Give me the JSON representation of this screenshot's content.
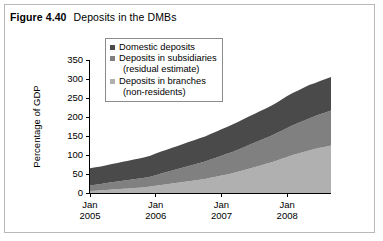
{
  "figure": {
    "number_label": "Figure 4.40",
    "title": "Deposits in the DMBs"
  },
  "legend": {
    "position": "top-center-inside",
    "items": [
      {
        "label": "Domestic deposits",
        "sublabel": "",
        "color": "#4a4a4a"
      },
      {
        "label": "Deposits in subsidiaries",
        "sublabel": "(residual estimate)",
        "color": "#808080"
      },
      {
        "label": "Deposits in branches",
        "sublabel": "(non-residents)",
        "color": "#b0b0b0"
      }
    ]
  },
  "axes": {
    "ylabel": "Percentage of GDP",
    "yticks": [
      "0",
      "50",
      "100",
      "150",
      "200",
      "250",
      "300",
      "350"
    ],
    "xticks": [
      {
        "month": "Jan",
        "year": "2005"
      },
      {
        "month": "Jan",
        "year": "2006"
      },
      {
        "month": "Jan",
        "year": "2007"
      },
      {
        "month": "Jan",
        "year": "2008"
      }
    ]
  },
  "chart_data": {
    "type": "area",
    "stacked": true,
    "title": "Deposits in the DMBs",
    "xlabel": "",
    "ylabel": "Percentage of GDP",
    "ylim": [
      0,
      350
    ],
    "grid": false,
    "legend_position": "top-center-inside",
    "x": [
      "Jan 2005",
      "Feb 2005",
      "Mar 2005",
      "Apr 2005",
      "May 2005",
      "Jun 2005",
      "Jul 2005",
      "Aug 2005",
      "Sep 2005",
      "Oct 2005",
      "Nov 2005",
      "Dec 2005",
      "Jan 2006",
      "Feb 2006",
      "Mar 2006",
      "Apr 2006",
      "May 2006",
      "Jun 2006",
      "Jul 2006",
      "Aug 2006",
      "Sep 2006",
      "Oct 2006",
      "Nov 2006",
      "Dec 2006",
      "Jan 2007",
      "Feb 2007",
      "Mar 2007",
      "Apr 2007",
      "May 2007",
      "Jun 2007",
      "Jul 2007",
      "Aug 2007",
      "Sep 2007",
      "Oct 2007",
      "Nov 2007",
      "Dec 2007",
      "Jan 2008",
      "Feb 2008",
      "Mar 2008",
      "Apr 2008",
      "May 2008",
      "Jun 2008",
      "Jul 2008",
      "Aug 2008",
      "Sep 2008"
    ],
    "series": [
      {
        "name": "Deposits in branches (non-residents)",
        "color": "#b0b0b0",
        "values": [
          5,
          6,
          7,
          8,
          9,
          10,
          11,
          12,
          13,
          14,
          15,
          17,
          19,
          21,
          23,
          25,
          27,
          29,
          31,
          33,
          35,
          37,
          40,
          43,
          46,
          49,
          52,
          56,
          60,
          64,
          68,
          72,
          76,
          80,
          85,
          90,
          95,
          100,
          104,
          108,
          112,
          116,
          119,
          122,
          125
        ]
      },
      {
        "name": "Deposits in subsidiaries (residual estimate)",
        "color": "#808080",
        "values": [
          15,
          16,
          17,
          18,
          19,
          20,
          21,
          22,
          23,
          24,
          25,
          26,
          28,
          30,
          32,
          34,
          36,
          38,
          40,
          42,
          44,
          46,
          48,
          50,
          52,
          54,
          56,
          58,
          60,
          62,
          64,
          66,
          68,
          70,
          72,
          74,
          76,
          78,
          80,
          82,
          84,
          86,
          88,
          90,
          92
        ]
      },
      {
        "name": "Domestic deposits",
        "color": "#4a4a4a",
        "values": [
          45,
          46,
          46,
          47,
          48,
          49,
          50,
          51,
          52,
          53,
          54,
          55,
          57,
          58,
          59,
          60,
          61,
          62,
          63,
          64,
          65,
          66,
          67,
          68,
          70,
          71,
          72,
          73,
          74,
          75,
          76,
          77,
          78,
          79,
          80,
          82,
          84,
          85,
          86,
          87,
          88,
          87,
          88,
          88,
          88
        ]
      }
    ],
    "totals": [
      65,
      68,
      70,
      73,
      76,
      79,
      82,
      85,
      88,
      91,
      94,
      98,
      104,
      109,
      114,
      119,
      124,
      129,
      134,
      139,
      144,
      149,
      155,
      161,
      168,
      174,
      180,
      187,
      194,
      201,
      208,
      215,
      222,
      229,
      237,
      246,
      255,
      263,
      270,
      277,
      284,
      289,
      295,
      300,
      305
    ]
  }
}
